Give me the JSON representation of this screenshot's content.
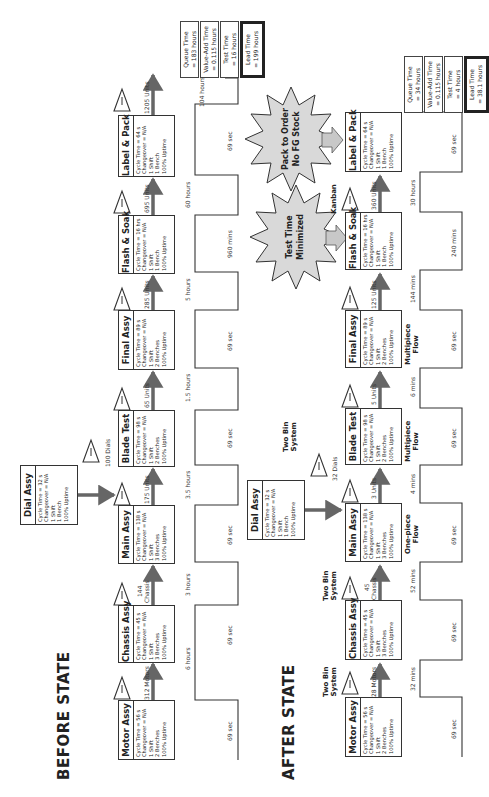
{
  "before": {
    "title": "BEFORE STATE",
    "processes": [
      {
        "name": "Motor Assy",
        "lines": [
          "Cycle Time = 56 s",
          "Changeover = N/A",
          "1 Shift",
          "2 Benches",
          "100% Uptime"
        ]
      },
      {
        "name": "Chassis Assy",
        "lines": [
          "Cycle Time = 45 s",
          "Changeover = N/A",
          "1 Shift",
          "3 Benches",
          "100% Uptime"
        ]
      },
      {
        "name": "Main Assy",
        "lines": [
          "Cycle Time = 138 s",
          "Changeover = N/A",
          "1 Shift",
          "3 Benches",
          "100% Uptime"
        ]
      },
      {
        "name": "Blade Test",
        "lines": [
          "Cycle Time = 98 s",
          "Changeover = N/A",
          "1 Shift",
          "2 Benches",
          "100% Uptime"
        ]
      },
      {
        "name": "Final Assy",
        "lines": [
          "Cycle Time = 89 s",
          "Changeover = N/A",
          "1 Shift",
          "2 Benches",
          "100% Uptime"
        ]
      },
      {
        "name": "Flash & Soak",
        "lines": [
          "Cycle Time = 16 hrs",
          "Changeover = N/A",
          "1 Shift",
          "1 Bench",
          "100% Uptime"
        ]
      },
      {
        "name": "Label & Pack",
        "lines": [
          "Cycle Time = 64 s",
          "Changeover = N/A",
          "1 Shift",
          "1 Bench",
          "100% Uptime"
        ]
      }
    ],
    "dial": {
      "name": "Dial Assy",
      "lines": [
        "Cycle Time = 32 s",
        "Changeover = N/A",
        "1 Shift",
        "1 Bench",
        "100% Uptime"
      ]
    },
    "inventory": [
      "312 Motors",
      "144",
      "Chassis",
      "175 Units",
      "65 Units",
      "285 Units",
      "695 Units",
      "1205 Units",
      "100 Dials"
    ],
    "timeline": {
      "wait": [
        "6 hours",
        "3 hours",
        "3.5 hours",
        "1.5 hours",
        "5 hours",
        "60 hours",
        "104 hours"
      ],
      "process": [
        "69 sec",
        "69 sec",
        "69 sec",
        "69 sec",
        "69 sec",
        "960 mins",
        "69 sec"
      ]
    },
    "summary": [
      {
        "label": "Queue Time",
        "value": "= 183 hours"
      },
      {
        "label": "Value-Add Time",
        "value": "= 0.115 hours"
      },
      {
        "label": "Test Time",
        "value": "= 16 hours"
      },
      {
        "label": "Lead Time",
        "value": "= 199 hours"
      }
    ]
  },
  "after": {
    "title": "AFTER STATE",
    "processes": [
      {
        "name": "Motor Assy",
        "lines": [
          "Cycle Time = 56 s",
          "Changeover = N/A",
          "1 Shift",
          "2 Benches",
          "100% Uptime"
        ]
      },
      {
        "name": "Chassis Assy",
        "lines": [
          "Cycle Time = 45 s",
          "Changeover = N/A",
          "1 Shift",
          "3 Benches",
          "100% Uptime"
        ]
      },
      {
        "name": "Main Assy",
        "lines": [
          "Cycle Time = 138 s",
          "Changeover = N/A",
          "1 Shift",
          "3 Benches",
          "100% Uptime"
        ]
      },
      {
        "name": "Blade Test",
        "lines": [
          "Cycle Time = 98 s",
          "Changeover = N/A",
          "1 Shift",
          "2 Benches",
          "100% Uptime"
        ]
      },
      {
        "name": "Final Assy",
        "lines": [
          "Cycle Time = 89 s",
          "Changeover = N/A",
          "1 Shift",
          "2 Benches",
          "100% Uptime"
        ]
      },
      {
        "name": "Flash & Soak",
        "lines": [
          "Cycle Time = 16 hrs",
          "Changeover = N/A",
          "1 Shift",
          "1 Bench",
          "100% Uptime"
        ]
      },
      {
        "name": "Label & Pack",
        "lines": [
          "Cycle Time = 64 s",
          "Changeover = N/A",
          "1 Shift",
          "1 Bench",
          "100% Uptime"
        ]
      }
    ],
    "dial": {
      "name": "Dial Assy",
      "lines": [
        "Cycle Time = 32 s",
        "Changeover = N/A",
        "1 Shift",
        "1 Bench",
        "100% Uptime"
      ]
    },
    "inventory": [
      "28 Motors",
      "45",
      "Chassis",
      "3 Units",
      "5 Units",
      "125 Units",
      "360 Units",
      "32 Dials"
    ],
    "notes": [
      "Two Bin",
      "System",
      "Two Bin",
      "System",
      "Two Bin",
      "System",
      "One-piece",
      "Flow",
      "Multipiece",
      "Flow",
      "Multipiece",
      "Flow",
      "Kanban"
    ],
    "bursts": [
      {
        "line1": "Test Time",
        "line2": "Minimized"
      },
      {
        "line1": "Pack to Order",
        "line2": "No FG Stock"
      }
    ],
    "timeline": {
      "wait": [
        "32 mins",
        "52 mins",
        "4 mins",
        "6 mins",
        "144 mins",
        "30 hours"
      ],
      "process": [
        "69 sec",
        "69 sec",
        "69 sec",
        "69 sec",
        "69 sec",
        "240 mins",
        "69 sec"
      ]
    },
    "summary": [
      {
        "label": "Queue Time",
        "value": "= 34 hours"
      },
      {
        "label": "Value-Add Time",
        "value": "= 0.115 hours"
      },
      {
        "label": "Test Time",
        "value": "= 4 hours"
      },
      {
        "label": "Lead Time",
        "value": "= 38.1 hours"
      }
    ]
  },
  "colors": {
    "arrow": "#666666",
    "burst": "#d9d9d9",
    "line": "#333333"
  }
}
